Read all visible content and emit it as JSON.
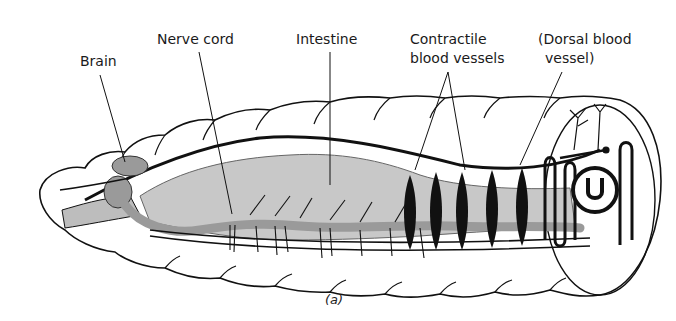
{
  "figure": {
    "caption": "(a)"
  },
  "labels": {
    "brain": "Brain",
    "nerve_cord": "Nerve cord",
    "intestine": "Intestine",
    "contractile_line1": "Contractile",
    "contractile_line2": "blood vessels",
    "dorsal_line1": "(Dorsal blood",
    "dorsal_line2": "vessel)"
  },
  "colors": {
    "ink": "#111111",
    "organ_gray": "#9a9a9a",
    "intestine_gray": "#c8c8c8",
    "background": "#ffffff"
  }
}
